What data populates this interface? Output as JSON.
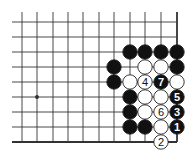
{
  "diagram": {
    "type": "go-board-fragment",
    "grid": {
      "xs": [
        22,
        37,
        53,
        68,
        83,
        99,
        114,
        130,
        145,
        161,
        177
      ],
      "ys": [
        22,
        37,
        52,
        67,
        82,
        97,
        112,
        127,
        142
      ],
      "left_x": 12,
      "top_y": 12,
      "right_edge_x": 177,
      "bottom_edge_y": 142,
      "line_color": "#333333",
      "edge_width": 1.8,
      "line_width": 0.9
    },
    "star_points": [
      {
        "col": 1,
        "row": 5
      }
    ],
    "stone_radius": 7.2,
    "stones": [
      {
        "col": 7,
        "row": 2,
        "color": "black"
      },
      {
        "col": 8,
        "row": 2,
        "color": "black"
      },
      {
        "col": 9,
        "row": 2,
        "color": "black"
      },
      {
        "col": 10,
        "row": 2,
        "color": "black"
      },
      {
        "col": 6,
        "row": 3,
        "color": "black"
      },
      {
        "col": 8,
        "row": 3,
        "color": "white"
      },
      {
        "col": 9,
        "row": 3,
        "color": "white"
      },
      {
        "col": 10,
        "row": 3,
        "color": "black"
      },
      {
        "col": 6,
        "row": 4,
        "color": "black"
      },
      {
        "col": 7,
        "row": 4,
        "color": "white"
      },
      {
        "col": 8,
        "row": 4,
        "color": "white",
        "label": "4"
      },
      {
        "col": 9,
        "row": 4,
        "color": "black",
        "label": "7"
      },
      {
        "col": 10,
        "row": 4,
        "color": "white"
      },
      {
        "col": 7,
        "row": 5,
        "color": "black"
      },
      {
        "col": 8,
        "row": 5,
        "color": "white"
      },
      {
        "col": 9,
        "row": 5,
        "color": "white"
      },
      {
        "col": 10,
        "row": 5,
        "color": "black",
        "label": "5"
      },
      {
        "col": 7,
        "row": 6,
        "color": "black"
      },
      {
        "col": 8,
        "row": 6,
        "color": "white"
      },
      {
        "col": 9,
        "row": 6,
        "color": "white",
        "label": "6"
      },
      {
        "col": 10,
        "row": 6,
        "color": "black",
        "label": "3"
      },
      {
        "col": 7,
        "row": 7,
        "color": "black"
      },
      {
        "col": 8,
        "row": 7,
        "color": "black"
      },
      {
        "col": 9,
        "row": 7,
        "color": "white"
      },
      {
        "col": 10,
        "row": 7,
        "color": "black",
        "label": "1"
      },
      {
        "col": 9,
        "row": 8,
        "color": "white",
        "label": "2"
      }
    ],
    "colors": {
      "black": "#111111",
      "white": "#ffffff",
      "outline": "#222222"
    }
  }
}
